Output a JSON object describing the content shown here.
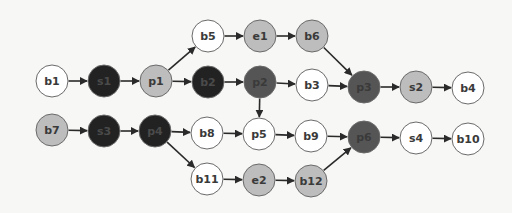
{
  "diagram": {
    "type": "directed-graph",
    "colors": {
      "white": "#ffffff",
      "light": "#bdbdbd",
      "dark": "#555555",
      "black": "#222222",
      "edge": "#2a2a2a"
    },
    "nodes": [
      {
        "id": "b5",
        "label": "b5",
        "x": 208,
        "y": 36,
        "shade": "white"
      },
      {
        "id": "e1",
        "label": "e1",
        "x": 260,
        "y": 36,
        "shade": "light"
      },
      {
        "id": "b6",
        "label": "b6",
        "x": 312,
        "y": 36,
        "shade": "light"
      },
      {
        "id": "b1",
        "label": "b1",
        "x": 52,
        "y": 81,
        "shade": "white"
      },
      {
        "id": "s1",
        "label": "s1",
        "x": 104,
        "y": 81,
        "shade": "black"
      },
      {
        "id": "p1",
        "label": "p1",
        "x": 156,
        "y": 81,
        "shade": "light"
      },
      {
        "id": "b2",
        "label": "b2",
        "x": 208,
        "y": 82,
        "shade": "black"
      },
      {
        "id": "p2",
        "label": "p2",
        "x": 260,
        "y": 82,
        "shade": "dark"
      },
      {
        "id": "b3",
        "label": "b3",
        "x": 312,
        "y": 85,
        "shade": "white"
      },
      {
        "id": "p3",
        "label": "p3",
        "x": 364,
        "y": 87,
        "shade": "dark"
      },
      {
        "id": "s2",
        "label": "s2",
        "x": 416,
        "y": 87,
        "shade": "light"
      },
      {
        "id": "b4",
        "label": "b4",
        "x": 468,
        "y": 88,
        "shade": "white"
      },
      {
        "id": "b7",
        "label": "b7",
        "x": 52,
        "y": 130,
        "shade": "light"
      },
      {
        "id": "s3",
        "label": "s3",
        "x": 104,
        "y": 131,
        "shade": "black"
      },
      {
        "id": "p4",
        "label": "p4",
        "x": 155,
        "y": 131,
        "shade": "black"
      },
      {
        "id": "b8",
        "label": "b8",
        "x": 207,
        "y": 133,
        "shade": "white"
      },
      {
        "id": "p5",
        "label": "p5",
        "x": 259,
        "y": 134,
        "shade": "white"
      },
      {
        "id": "b9",
        "label": "b9",
        "x": 311,
        "y": 136,
        "shade": "white"
      },
      {
        "id": "p6",
        "label": "p6",
        "x": 364,
        "y": 137,
        "shade": "dark"
      },
      {
        "id": "s4",
        "label": "s4",
        "x": 416,
        "y": 138,
        "shade": "white"
      },
      {
        "id": "b10",
        "label": "b10",
        "x": 468,
        "y": 139,
        "shade": "white"
      },
      {
        "id": "b11",
        "label": "b11",
        "x": 207,
        "y": 179,
        "shade": "white"
      },
      {
        "id": "e2",
        "label": "e2",
        "x": 259,
        "y": 180,
        "shade": "light"
      },
      {
        "id": "b12",
        "label": "b12",
        "x": 311,
        "y": 181,
        "shade": "light"
      }
    ],
    "edges": [
      {
        "from": "b1",
        "to": "s1"
      },
      {
        "from": "s1",
        "to": "p1"
      },
      {
        "from": "p1",
        "to": "b5"
      },
      {
        "from": "p1",
        "to": "b2"
      },
      {
        "from": "b5",
        "to": "e1"
      },
      {
        "from": "e1",
        "to": "b6"
      },
      {
        "from": "b6",
        "to": "p3"
      },
      {
        "from": "b2",
        "to": "p2"
      },
      {
        "from": "p2",
        "to": "b3"
      },
      {
        "from": "p2",
        "to": "p5"
      },
      {
        "from": "b3",
        "to": "p3"
      },
      {
        "from": "p3",
        "to": "s2"
      },
      {
        "from": "s2",
        "to": "b4"
      },
      {
        "from": "b7",
        "to": "s3"
      },
      {
        "from": "s3",
        "to": "p4"
      },
      {
        "from": "p4",
        "to": "b8"
      },
      {
        "from": "p4",
        "to": "b11"
      },
      {
        "from": "b8",
        "to": "p5"
      },
      {
        "from": "p5",
        "to": "b9"
      },
      {
        "from": "b9",
        "to": "p6"
      },
      {
        "from": "p6",
        "to": "s4"
      },
      {
        "from": "s4",
        "to": "b10"
      },
      {
        "from": "b11",
        "to": "e2"
      },
      {
        "from": "e2",
        "to": "b12"
      },
      {
        "from": "b12",
        "to": "p6"
      }
    ]
  }
}
